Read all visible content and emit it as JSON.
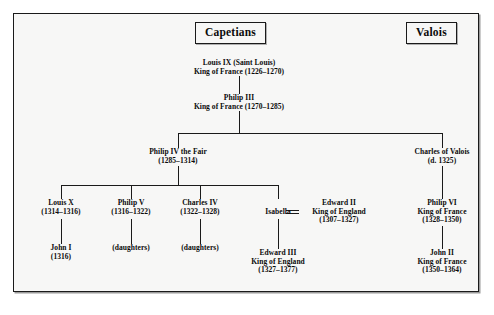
{
  "diagram": {
    "dynasties": [
      {
        "key": "capetians",
        "label": "Capetians"
      },
      {
        "key": "valois",
        "label": "Valois"
      }
    ],
    "nodes": {
      "louis_ix": {
        "line1": "Louis IX (Saint Louis)",
        "line2": "King of France (1226–1270)"
      },
      "philip_iii": {
        "line1": "Philip III",
        "line2": "King of France (1270–1285)"
      },
      "philip_iv": {
        "line1": "Philip IV the Fair",
        "line2": "(1285–1314)"
      },
      "charles_valois": {
        "line1": "Charles of Valois",
        "line2": "(d. 1325)"
      },
      "louis_x": {
        "line1": "Louis X",
        "line2": "(1314–1316)"
      },
      "philip_v": {
        "line1": "Philip V",
        "line2": "(1316–1322)"
      },
      "charles_iv": {
        "line1": "Charles IV",
        "line2": "(1322–1328)"
      },
      "isabella": {
        "line1": "Isabella"
      },
      "edward_ii": {
        "line1": "Edward II",
        "line2": "King of England",
        "line3": "(1307–1327)"
      },
      "philip_vi": {
        "line1": "Philip VI",
        "line2": "King of France",
        "line3": "(1328–1350)"
      },
      "john_i": {
        "line1": "John I",
        "line2": "(1316)"
      },
      "daughters_philip_v": {
        "line1": "(daughters)"
      },
      "daughters_charles_iv": {
        "line1": "(daughters)"
      },
      "edward_iii": {
        "line1": "Edward III",
        "line2": "King of England",
        "line3": "(1327–1377)"
      },
      "john_ii": {
        "line1": "John II",
        "line2": "King of France",
        "line3": "(1350–1364)"
      }
    },
    "colors": {
      "ink": "#0b0b0b",
      "line": "#1a1a1a",
      "page": "#f7f7f6",
      "border": "#1a1a1a"
    }
  }
}
